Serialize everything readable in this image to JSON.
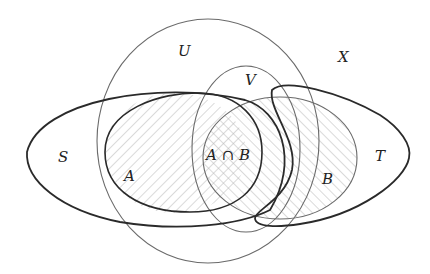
{
  "diagram": {
    "type": "venn",
    "labels": {
      "U": "U",
      "V": "V",
      "X": "X",
      "S": "S",
      "T": "T",
      "A": "A",
      "B": "B",
      "AB": "A ∩ B"
    },
    "colors": {
      "thick_stroke": "#2a2a2a",
      "thin_stroke": "#6a6a6a",
      "hatch": "#b8b8b8",
      "background": "#ffffff"
    }
  }
}
